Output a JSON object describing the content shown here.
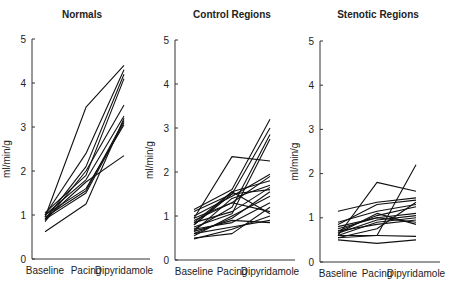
{
  "chart_data": [
    {
      "type": "line",
      "title": "Normals",
      "xlabel": "",
      "ylabel": "ml/min/g",
      "categories": [
        "Baseline",
        "Pacing",
        "Dipyridamole"
      ],
      "yticks": [
        0,
        1,
        2,
        3,
        4,
        5
      ],
      "ylim": [
        0,
        5
      ],
      "grid": false,
      "legend": "none",
      "layout": {
        "axis_x": 32,
        "x_end": 150,
        "y0": 259,
        "y5": 39,
        "cat_x": [
          45,
          86,
          124
        ],
        "title_x": 82,
        "title_y": 18
      },
      "series": [
        {
          "name": "subject 1",
          "values": [
            0.95,
            3.45,
            4.4
          ]
        },
        {
          "name": "subject 2",
          "values": [
            1.0,
            2.4,
            4.3
          ]
        },
        {
          "name": "subject 3",
          "values": [
            0.9,
            2.1,
            4.2
          ]
        },
        {
          "name": "subject 4",
          "values": [
            1.05,
            1.9,
            4.1
          ]
        },
        {
          "name": "subject 5",
          "values": [
            0.85,
            2.0,
            3.5
          ]
        },
        {
          "name": "subject 6",
          "values": [
            1.0,
            1.8,
            3.25
          ]
        },
        {
          "name": "subject 7",
          "values": [
            0.95,
            1.55,
            3.15
          ]
        },
        {
          "name": "subject 8",
          "values": [
            0.9,
            1.5,
            3.1
          ]
        },
        {
          "name": "subject 9",
          "values": [
            1.0,
            1.6,
            3.05
          ]
        },
        {
          "name": "subject 10",
          "values": [
            0.9,
            1.75,
            2.35
          ]
        },
        {
          "name": "subject 11",
          "values": [
            0.62,
            1.25,
            3.2
          ]
        }
      ]
    },
    {
      "type": "line",
      "title": "Control Regions",
      "xlabel": "",
      "ylabel": "ml/min/g",
      "categories": [
        "Baseline",
        "Pacing",
        "Dipyridamole"
      ],
      "yticks": [
        0,
        1,
        2,
        3,
        4,
        5
      ],
      "ylim": [
        0,
        5
      ],
      "grid": false,
      "legend": "none",
      "layout": {
        "axis_x": 175,
        "x_end": 295,
        "y0": 260,
        "y5": 40,
        "cat_x": [
          194,
          232,
          270
        ],
        "title_x": 232,
        "title_y": 18
      },
      "series": [
        {
          "name": "region 1",
          "values": [
            0.95,
            2.35,
            2.25
          ]
        },
        {
          "name": "region 2",
          "values": [
            1.15,
            1.6,
            3.2
          ]
        },
        {
          "name": "region 3",
          "values": [
            0.8,
            1.5,
            3.0
          ]
        },
        {
          "name": "region 4",
          "values": [
            0.7,
            1.2,
            2.85
          ]
        },
        {
          "name": "region 5",
          "values": [
            0.75,
            1.05,
            2.75
          ]
        },
        {
          "name": "region 6",
          "values": [
            1.0,
            1.45,
            1.95
          ]
        },
        {
          "name": "region 7",
          "values": [
            0.9,
            1.3,
            1.9
          ]
        },
        {
          "name": "region 8",
          "values": [
            0.85,
            1.55,
            1.8
          ]
        },
        {
          "name": "region 9",
          "values": [
            0.65,
            1.4,
            1.7
          ]
        },
        {
          "name": "region 10",
          "values": [
            1.1,
            1.5,
            1.6
          ]
        },
        {
          "name": "region 11",
          "values": [
            0.6,
            0.95,
            1.55
          ]
        },
        {
          "name": "region 12",
          "values": [
            0.55,
            1.0,
            1.45
          ]
        },
        {
          "name": "region 13",
          "values": [
            0.95,
            1.3,
            1.1
          ]
        },
        {
          "name": "region 14",
          "values": [
            0.7,
            0.85,
            1.3
          ]
        },
        {
          "name": "region 15",
          "values": [
            0.8,
            1.55,
            1.05
          ]
        },
        {
          "name": "region 16",
          "values": [
            0.6,
            0.75,
            0.9
          ]
        },
        {
          "name": "region 17",
          "values": [
            0.5,
            0.6,
            1.2
          ]
        },
        {
          "name": "region 18",
          "values": [
            0.65,
            0.9,
            0.85
          ]
        },
        {
          "name": "region 19",
          "values": [
            0.48,
            0.7,
            1.0
          ]
        },
        {
          "name": "region 20",
          "values": [
            0.85,
            1.1,
            1.65
          ]
        }
      ]
    },
    {
      "type": "line",
      "title": "Stenotic Regions",
      "xlabel": "",
      "ylabel": "ml/min/g",
      "categories": [
        "Baseline",
        "Pacing",
        "Dipyridamole"
      ],
      "yticks": [
        0,
        1,
        2,
        3,
        4,
        5
      ],
      "ylim": [
        0,
        5
      ],
      "grid": false,
      "legend": "none",
      "layout": {
        "axis_x": 320,
        "x_end": 440,
        "y0": 262,
        "y5": 41,
        "cat_x": [
          338,
          377,
          416
        ],
        "title_x": 378,
        "title_y": 18
      },
      "series": [
        {
          "name": "region 1",
          "values": [
            0.55,
            0.6,
            2.2
          ]
        },
        {
          "name": "region 2",
          "values": [
            0.6,
            1.8,
            1.6
          ]
        },
        {
          "name": "region 3",
          "values": [
            1.15,
            1.35,
            1.45
          ]
        },
        {
          "name": "region 4",
          "values": [
            0.85,
            1.3,
            1.4
          ]
        },
        {
          "name": "region 5",
          "values": [
            0.9,
            1.15,
            1.3
          ]
        },
        {
          "name": "region 6",
          "values": [
            0.7,
            1.05,
            1.25
          ]
        },
        {
          "name": "region 7",
          "values": [
            0.75,
            1.0,
            1.1
          ]
        },
        {
          "name": "region 8",
          "values": [
            0.65,
            0.95,
            1.05
          ]
        },
        {
          "name": "region 9",
          "values": [
            0.6,
            0.9,
            1.0
          ]
        },
        {
          "name": "region 10",
          "values": [
            0.7,
            0.85,
            0.95
          ]
        },
        {
          "name": "region 11",
          "values": [
            0.8,
            1.0,
            0.9
          ]
        },
        {
          "name": "region 12",
          "values": [
            0.55,
            0.75,
            1.35
          ]
        },
        {
          "name": "region 13",
          "values": [
            0.6,
            0.6,
            0.58
          ]
        },
        {
          "name": "region 14",
          "values": [
            0.5,
            0.42,
            0.5
          ]
        },
        {
          "name": "region 15",
          "values": [
            0.65,
            1.1,
            0.85
          ]
        }
      ]
    }
  ]
}
